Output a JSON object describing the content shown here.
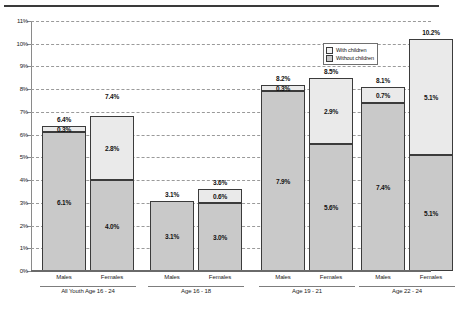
{
  "chart_data": {
    "type": "bar",
    "subtype": "stacked-bar-grouped",
    "title": "",
    "xlabel": "",
    "ylabel": "",
    "ylim": [
      0,
      11
    ],
    "ytick_step": 1,
    "ytick_labels": [
      "0%",
      "1%",
      "2%",
      "3%",
      "4%",
      "5%",
      "6%",
      "7%",
      "8%",
      "9%",
      "10%",
      "11%"
    ],
    "grid": true,
    "grid_style": "dashed horizontal",
    "legend_position": "top-right inside plot",
    "legend": [
      {
        "key": "with_children",
        "label": "With children",
        "color": "#eaeaea"
      },
      {
        "key": "without_children",
        "label": "Without children",
        "color": "#c9c9c9"
      }
    ],
    "series": [
      {
        "name": "Without children",
        "values": [
          6.1,
          4.0,
          3.1,
          3.0,
          7.9,
          5.6,
          7.4,
          5.1
        ]
      },
      {
        "name": "With children",
        "values": [
          0.3,
          2.8,
          0.0,
          0.6,
          0.3,
          2.9,
          0.7,
          5.1
        ]
      }
    ],
    "categories": [
      "Males",
      "Females",
      "Males",
      "Females",
      "Males",
      "Females",
      "Males",
      "Females"
    ],
    "totals": [
      6.4,
      7.4,
      3.1,
      3.6,
      8.2,
      8.5,
      8.1,
      10.2
    ],
    "groups": [
      {
        "label": "All Youth Age 16 - 24",
        "bars": [
          {
            "sex": "Males",
            "without": 6.1,
            "with": 0.3,
            "total": 6.4,
            "without_label": "6.1%",
            "with_label": "0.3%",
            "total_label": "6.4%"
          },
          {
            "sex": "Females",
            "without": 4.0,
            "with": 2.8,
            "total": 7.4,
            "without_label": "4.0%",
            "with_label": "2.8%",
            "total_label": "7.4%"
          }
        ]
      },
      {
        "label": "Age 16 - 18",
        "bars": [
          {
            "sex": "Males",
            "without": 3.1,
            "with": 0.0,
            "total": 3.1,
            "without_label": "3.1%",
            "with_label": "",
            "total_label": "3.1%"
          },
          {
            "sex": "Females",
            "without": 3.0,
            "with": 0.6,
            "total": 3.6,
            "without_label": "3.0%",
            "with_label": "0.6%",
            "total_label": "3.6%"
          }
        ]
      },
      {
        "label": "Age 19 - 21",
        "bars": [
          {
            "sex": "Males",
            "without": 7.9,
            "with": 0.3,
            "total": 8.2,
            "without_label": "7.9%",
            "with_label": "0.3%",
            "total_label": "8.2%"
          },
          {
            "sex": "Females",
            "without": 5.6,
            "with": 2.9,
            "total": 8.5,
            "without_label": "5.6%",
            "with_label": "2.9%",
            "total_label": "8.5%"
          }
        ]
      },
      {
        "label": "Age 22 - 24",
        "bars": [
          {
            "sex": "Males",
            "without": 7.4,
            "with": 0.7,
            "total": 8.1,
            "without_label": "7.4%",
            "with_label": "0.7%",
            "total_label": "8.1%"
          },
          {
            "sex": "Females",
            "without": 5.1,
            "with": 5.1,
            "total": 10.2,
            "without_label": "5.1%",
            "with_label": "5.1%",
            "total_label": "10.2%"
          }
        ]
      }
    ]
  },
  "colors": {
    "with_children": "#eaeaea",
    "without_children": "#c9c9c9",
    "bar_border": "#3b3b3b",
    "grid": "#9a9a9a",
    "axis": "#6a6a6a",
    "background": "#ffffff"
  }
}
